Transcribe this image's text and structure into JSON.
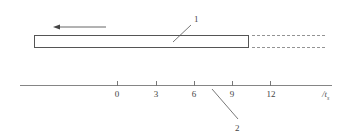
{
  "diagram": {
    "part_labels": {
      "label_1": "1",
      "label_2": "2"
    },
    "axis": {
      "ticks": [
        "0",
        "3",
        "6",
        "9",
        "12"
      ],
      "unit_main": "/t",
      "unit_sub": "s"
    },
    "colors": {
      "line": "#555555",
      "background": "#ffffff"
    }
  }
}
